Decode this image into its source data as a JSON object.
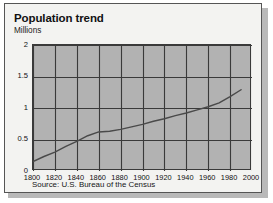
{
  "card": {
    "title": "Population trend",
    "subtitle": "Millions",
    "source": "Source: U.S. Bureau of the Census"
  },
  "colors": {
    "plot_background": "#b2b2b2",
    "card_background": "#f3f3f1",
    "grid": "#3a3a3a",
    "line": "#4a4a4a",
    "border": "#555555",
    "shadow": "#b9b9b9"
  },
  "chart_data": {
    "type": "line",
    "title": "Population trend",
    "subtitle": "Millions",
    "xlabel": "",
    "ylabel": "Millions",
    "xlim": [
      1800,
      2000
    ],
    "ylim": [
      0,
      2
    ],
    "xticks": [
      1800,
      1820,
      1840,
      1860,
      1880,
      1900,
      1920,
      1940,
      1960,
      1980,
      2000
    ],
    "xtick_labels": [
      "1800",
      "1820",
      "1840",
      "1860",
      "1880",
      "1900",
      "1920",
      "1940",
      "1960",
      "1980",
      "2000"
    ],
    "yticks": [
      0,
      0.5,
      1,
      1.5,
      2
    ],
    "ytick_labels": [
      "0",
      "0.5",
      "1",
      "1.5",
      "2"
    ],
    "grid": true,
    "legend": null,
    "source": "Source: U.S. Bureau of the Census",
    "series": [
      {
        "name": "Population",
        "x": [
          1800,
          1810,
          1820,
          1830,
          1840,
          1850,
          1860,
          1870,
          1880,
          1890,
          1900,
          1910,
          1920,
          1930,
          1940,
          1950,
          1960,
          1970,
          1980,
          1990
        ],
        "values": [
          0.15,
          0.23,
          0.3,
          0.39,
          0.47,
          0.56,
          0.62,
          0.63,
          0.66,
          0.7,
          0.74,
          0.79,
          0.83,
          0.88,
          0.92,
          0.97,
          1.02,
          1.08,
          1.18,
          1.29
        ]
      }
    ]
  }
}
